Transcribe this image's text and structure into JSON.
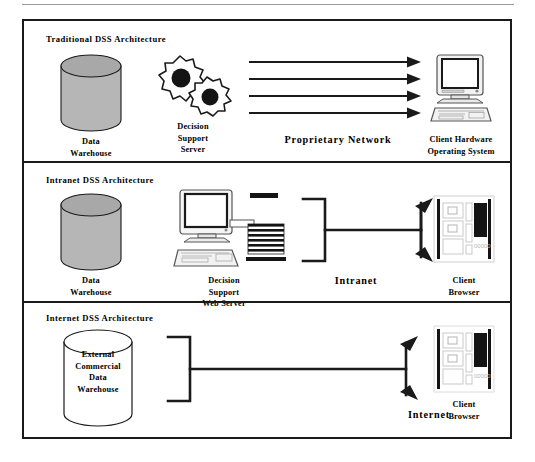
{
  "figure": {
    "panels": [
      {
        "id": "traditional",
        "title": "Traditional  DSS  Architecture",
        "nodes": [
          {
            "name": "data-warehouse",
            "icon": "cylinder-gray",
            "caption": "Data\nWarehouse"
          },
          {
            "name": "decision-support-server",
            "icon": "gears",
            "caption": "Decision\nSupport\nServer"
          },
          {
            "name": "client-hardware",
            "icon": "desktop-computer",
            "caption": "Client Hardware\nOperating System"
          }
        ],
        "connector": {
          "name": "proprietary-network",
          "type": "parallel-arrows",
          "count": 4,
          "label": "Proprietary  Network"
        }
      },
      {
        "id": "intranet",
        "title": "Intranet  DSS  Architecture",
        "nodes": [
          {
            "name": "data-warehouse",
            "icon": "cylinder-gray",
            "caption": "Data\nWarehouse"
          },
          {
            "name": "decision-support-web-server",
            "icon": "computer-with-server-rack",
            "caption": "Decision\nSupport\nWeb Server"
          },
          {
            "name": "client-browser",
            "icon": "browser-window",
            "caption": "Client\nBrowser"
          }
        ],
        "connector": {
          "name": "intranet-link",
          "type": "bracket-bus",
          "label": "Intranet"
        }
      },
      {
        "id": "internet",
        "title": "Internet  DSS  Architecture",
        "nodes": [
          {
            "name": "external-commercial-data-warehouse",
            "icon": "cylinder-white",
            "caption": "External\nCommercial\nData\nWarehouse"
          },
          {
            "name": "client-browser",
            "icon": "browser-window",
            "caption": "Client\nBrowser"
          }
        ],
        "connector": {
          "name": "internet-link",
          "type": "bracket-bus",
          "label": "Internet"
        }
      }
    ]
  },
  "colors": {
    "ink": "#1a1a1a",
    "cylinder_body": "#b6b6b6",
    "cylinder_top": "#a8a8a8",
    "screen_dark": "#141414",
    "device_light": "#f2f2f2",
    "device_edge": "#555555",
    "rule": "#9a9a9a"
  },
  "labels": {
    "line1": "Proprietary  Network",
    "line2": "Intranet",
    "line3": "Internet"
  }
}
